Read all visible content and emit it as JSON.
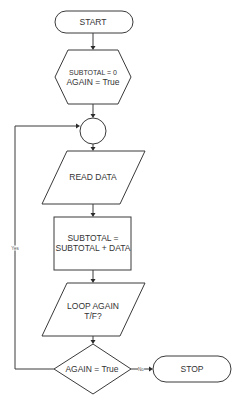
{
  "diagram": {
    "type": "flowchart",
    "nodes": {
      "start": {
        "label": "START",
        "shape": "terminal"
      },
      "init": {
        "line1": "SUBTOTAL = 0",
        "line2": "AGAIN = True",
        "shape": "hexagon"
      },
      "connector": {
        "label": "",
        "shape": "circle"
      },
      "read": {
        "label": "READ DATA",
        "shape": "parallelogram"
      },
      "process": {
        "line1": "SUBTOTAL =",
        "line2": "SUBTOTAL + DATA",
        "shape": "rectangle"
      },
      "input": {
        "line1": "LOOP AGAIN",
        "line2": "T/F?",
        "shape": "parallelogram"
      },
      "decision": {
        "label": "AGAIN = True",
        "shape": "diamond"
      },
      "stop": {
        "label": "STOP",
        "shape": "terminal"
      }
    },
    "edges": [
      {
        "from": "start",
        "to": "init",
        "label": ""
      },
      {
        "from": "init",
        "to": "connector",
        "label": ""
      },
      {
        "from": "connector",
        "to": "read",
        "label": ""
      },
      {
        "from": "read",
        "to": "process",
        "label": ""
      },
      {
        "from": "process",
        "to": "input",
        "label": ""
      },
      {
        "from": "input",
        "to": "decision",
        "label": ""
      },
      {
        "from": "decision",
        "to": "connector",
        "label": "Yes"
      },
      {
        "from": "decision",
        "to": "stop",
        "label": "No"
      }
    ],
    "edge_labels": {
      "yes": "Yes",
      "no": "No"
    },
    "colors": {
      "stroke": "#3a3a3a",
      "text": "#333333",
      "background": "#ffffff"
    }
  }
}
